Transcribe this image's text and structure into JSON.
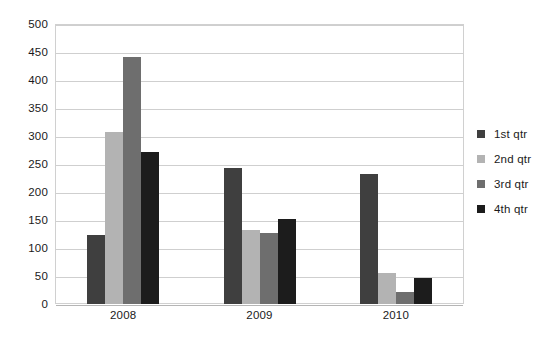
{
  "chart_data": {
    "type": "bar",
    "title": "",
    "subtitle": "",
    "xlabel": "",
    "ylabel": "",
    "categories": [
      "2008",
      "2009",
      "2010"
    ],
    "series": [
      {
        "name": "1st qtr",
        "color": "#3f3f3f",
        "values": [
          124,
          243,
          232
        ]
      },
      {
        "name": "2nd qtr",
        "color": "#b3b3b3",
        "values": [
          307,
          132,
          55
        ]
      },
      {
        "name": "3rd qtr",
        "color": "#6e6e6e",
        "values": [
          441,
          127,
          22
        ]
      },
      {
        "name": "4th qtr",
        "color": "#1c1c1c",
        "values": [
          271,
          151,
          46
        ]
      }
    ],
    "ylim": [
      0,
      500
    ],
    "ytick_step": 50,
    "ytick_labels": [
      "0",
      "50",
      "100",
      "150",
      "200",
      "250",
      "300",
      "350",
      "400",
      "450",
      "500"
    ],
    "grid": true,
    "grid_axis": "y",
    "grid_color": "#cfcfcf",
    "legend_position": "right",
    "background_color": "#ffffff",
    "plot_border_color": "#d0d0d0",
    "text_color": "#1a1a1a"
  },
  "legend": {
    "items": [
      {
        "label": "1st qtr",
        "color": "#3f3f3f"
      },
      {
        "label": "2nd qtr",
        "color": "#b3b3b3"
      },
      {
        "label": "3rd qtr",
        "color": "#6e6e6e"
      },
      {
        "label": "4th qtr",
        "color": "#1c1c1c"
      }
    ]
  }
}
